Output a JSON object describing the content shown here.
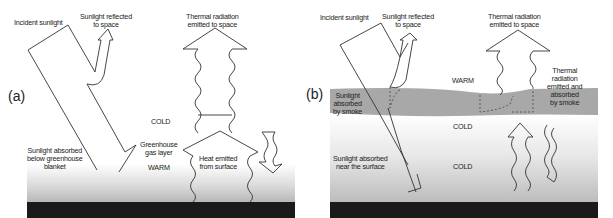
{
  "figure": {
    "panel_a": {
      "letter": "(a)",
      "labels": {
        "incident_sunlight": "Incident sunlight",
        "reflected_1": "Sunlight reflected",
        "reflected_2": "to space",
        "thermal_1": "Thermal radiation",
        "thermal_2": "emitted to space",
        "cold": "COLD",
        "absorbed_1": "Sunlight absorbed",
        "absorbed_2": "below greenhouse",
        "absorbed_3": "blanket",
        "ghg_1": "Greenhouse",
        "ghg_2": "gas layer",
        "warm": "WARM",
        "heat_1": "Heat emitted",
        "heat_2": "from surface"
      }
    },
    "panel_b": {
      "letter": "(b)",
      "labels": {
        "incident_sunlight": "Incident sunlight",
        "reflected_1": "Sunlight reflected",
        "reflected_2": "to space",
        "thermal_1": "Thermal radiation",
        "thermal_2": "emitted to space",
        "warm": "WARM",
        "smoke_thermal_1": "Thermal",
        "smoke_thermal_2": "radiation",
        "smoke_thermal_3": "emitted and",
        "smoke_thermal_4": "absorbed",
        "smoke_thermal_5": "by smoke",
        "smoke_sun_1": "Sunlight",
        "smoke_sun_2": "absorbed",
        "smoke_sun_3": "by smoke",
        "cold_mid": "COLD",
        "surface_1": "Sunlight absorbed",
        "surface_2": "near the surface",
        "cold_low": "COLD"
      }
    },
    "colors": {
      "ground": "#1a1a1a",
      "smoke_layer": "#a8a8a8",
      "line": "#333333",
      "background": "#ffffff"
    }
  }
}
